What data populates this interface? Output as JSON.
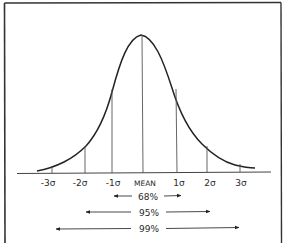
{
  "diagram": {
    "colors": {
      "ink": "#2a2a2a",
      "thin": "#555555",
      "background": "#ffffff"
    },
    "axis_labels": [
      {
        "id": "neg3",
        "text": "-3σ",
        "x": 52
      },
      {
        "id": "neg2",
        "text": "-2σ",
        "x": 85
      },
      {
        "id": "neg1",
        "text": "-1σ",
        "x": 112
      },
      {
        "id": "mean",
        "text": "MEAN",
        "x": 143
      },
      {
        "id": "pos1",
        "text": "1σ",
        "x": 177
      },
      {
        "id": "pos2",
        "text": "2σ",
        "x": 207
      },
      {
        "id": "pos3",
        "text": "3σ",
        "x": 240
      }
    ],
    "ranges": [
      {
        "id": "r68",
        "label": "68%",
        "x1": 114,
        "x2": 180,
        "y": 196
      },
      {
        "id": "r95",
        "label": "95%",
        "x1": 86,
        "x2": 209,
        "y": 212
      },
      {
        "id": "r99",
        "label": "99%",
        "x1": 56,
        "x2": 238,
        "y": 229
      }
    ]
  }
}
